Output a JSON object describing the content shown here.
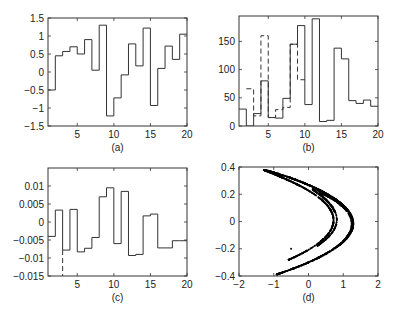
{
  "chart_data": [
    {
      "id": "a",
      "type": "line",
      "style": "stairs",
      "caption": "(a)",
      "xlim": [
        1,
        20
      ],
      "ylim": [
        -1.5,
        1.5
      ],
      "xticks": [
        5,
        10,
        15,
        20
      ],
      "xtick_labels": [
        "5",
        "10",
        "15",
        "20"
      ],
      "yticks": [
        -1.5,
        -1,
        -0.5,
        0,
        0.5,
        1,
        1.5
      ],
      "ytick_labels": [
        "-1.5",
        "-1",
        "-0.5",
        "0",
        "0.5",
        "1",
        "1.5"
      ],
      "grid": false,
      "series": [
        {
          "name": "solid",
          "line": "solid",
          "x": [
            1,
            2,
            3,
            4,
            5,
            6,
            7,
            8,
            9,
            10,
            11,
            12,
            13,
            14,
            15,
            16,
            17,
            18,
            19,
            20
          ],
          "values": [
            -0.5,
            0.45,
            0.57,
            0.7,
            0.5,
            0.9,
            0.05,
            1.3,
            -1.22,
            -0.72,
            -0.08,
            0.78,
            0.17,
            1.22,
            -0.93,
            0.1,
            0.72,
            0.35,
            1.05,
            1.05
          ]
        }
      ]
    },
    {
      "id": "b",
      "type": "line",
      "style": "stairs",
      "caption": "(b)",
      "xlim": [
        1,
        20
      ],
      "ylim": [
        0,
        195
      ],
      "xticks": [
        5,
        10,
        15,
        20
      ],
      "xtick_labels": [
        "5",
        "10",
        "15",
        "20"
      ],
      "yticks": [
        0,
        50,
        100,
        150
      ],
      "ytick_labels": [
        "0",
        "50",
        "100",
        "150"
      ],
      "grid": false,
      "series": [
        {
          "name": "solid",
          "line": "solid",
          "x": [
            1,
            2,
            3,
            4,
            5,
            6,
            7,
            8,
            9,
            10,
            11,
            12,
            13,
            14,
            15,
            16,
            17,
            18,
            19,
            20
          ],
          "values": [
            30,
            0,
            22,
            80,
            15,
            14,
            49,
            145,
            178,
            38,
            190,
            8,
            10,
            138,
            119,
            45,
            40,
            46,
            35,
            35
          ]
        },
        {
          "name": "dashed",
          "line": "dashed",
          "x": [
            2,
            3,
            4,
            5,
            6,
            7,
            8,
            9,
            10
          ],
          "values": [
            66,
            18,
            160,
            15,
            29,
            33,
            145,
            82,
            82
          ]
        }
      ]
    },
    {
      "id": "c",
      "type": "line",
      "style": "stairs",
      "caption": "(c)",
      "xlim": [
        1,
        20
      ],
      "ylim": [
        -0.015,
        0.015
      ],
      "xticks": [
        5,
        10,
        15,
        20
      ],
      "xtick_labels": [
        "5",
        "10",
        "15",
        "20"
      ],
      "yticks": [
        -0.015,
        -0.01,
        -0.005,
        0,
        0.005,
        0.01
      ],
      "ytick_labels": [
        "-0.015",
        "-0.01",
        "-0.005",
        "0",
        "0.005",
        "0.01"
      ],
      "grid": false,
      "series": [
        {
          "name": "solid",
          "line": "solid",
          "x": [
            1,
            2,
            3,
            4,
            5,
            6,
            7,
            8,
            9,
            10,
            11,
            12,
            13,
            14,
            15,
            16,
            17,
            18,
            19,
            20
          ],
          "values": [
            -0.004,
            0.0033,
            -0.0078,
            0.0035,
            -0.0083,
            -0.0073,
            -0.0043,
            0.007,
            0.0095,
            -0.006,
            0.0085,
            -0.0093,
            -0.009,
            0.0017,
            0.0022,
            -0.0072,
            -0.0072,
            -0.0052,
            -0.0052,
            -0.0052
          ]
        },
        {
          "name": "dashed",
          "line": "dashed",
          "x": [
            3,
            3
          ],
          "values": [
            -0.0078,
            -0.015
          ]
        }
      ]
    },
    {
      "id": "d",
      "type": "scatter",
      "caption": "(d)",
      "xlim": [
        -2,
        2
      ],
      "ylim": [
        -0.4,
        0.4
      ],
      "xticks": [
        -2,
        -1,
        0,
        1,
        2
      ],
      "xtick_labels": [
        "-2",
        "-1",
        "0",
        "1",
        "2"
      ],
      "yticks": [
        -0.4,
        -0.2,
        0,
        0.2,
        0.4
      ],
      "ytick_labels": [
        "-0.4",
        "-0.2",
        "0",
        "0.2",
        "0.4"
      ],
      "grid": false,
      "description": "Henon-type strange attractor: x_{n+1} = 1 - a x_n^2 + y_n, y_{n+1} = b x_n (a=1.4, b=0.3)",
      "series": [
        {
          "name": "attractor",
          "marker": "dot",
          "a": 1.4,
          "b": 0.3,
          "points": 2500
        }
      ]
    }
  ]
}
